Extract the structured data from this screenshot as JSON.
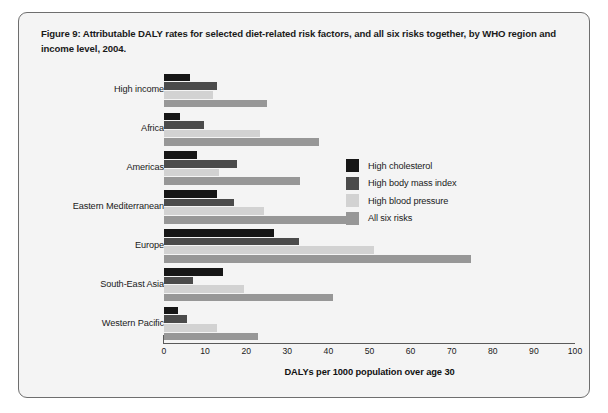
{
  "figure": {
    "caption": "Figure 9: Attributable DALY rates for selected diet-related risk factors, and all six risks together, by WHO region and income level, 2004."
  },
  "chart_data": {
    "type": "bar",
    "orientation": "horizontal",
    "title": "Figure 9: Attributable DALY rates for selected diet-related risk factors, and all six risks together, by WHO region and income level, 2004.",
    "xlabel": "DALYs per 1000 population over age 30",
    "ylabel": "",
    "xlim": [
      0,
      100
    ],
    "xticks": [
      0,
      10,
      20,
      30,
      40,
      50,
      60,
      70,
      80,
      90,
      100
    ],
    "grid": false,
    "legend_position": "right-inside",
    "categories": [
      "High income",
      "Africa",
      "Americas",
      "Eastern Mediterranean",
      "Europe",
      "South-East Asia",
      "Western Pacific"
    ],
    "series": [
      {
        "name": "High cholesterol",
        "color": "#161616",
        "values": [
          6.3,
          3.9,
          8.1,
          12.8,
          26.8,
          14.3,
          3.4
        ]
      },
      {
        "name": "High body mass index",
        "color": "#4b4b4b",
        "values": [
          12.8,
          9.8,
          17.7,
          17.1,
          32.8,
          7.1,
          5.6
        ]
      },
      {
        "name": "High blood pressure",
        "color": "#d2d2d2",
        "values": [
          12.0,
          23.4,
          13.5,
          24.4,
          51.2,
          19.5,
          13.0
        ]
      },
      {
        "name": "All six risks",
        "color": "#979797",
        "values": [
          25.0,
          37.6,
          33.2,
          46.3,
          74.6,
          41.0,
          22.9
        ]
      }
    ]
  }
}
